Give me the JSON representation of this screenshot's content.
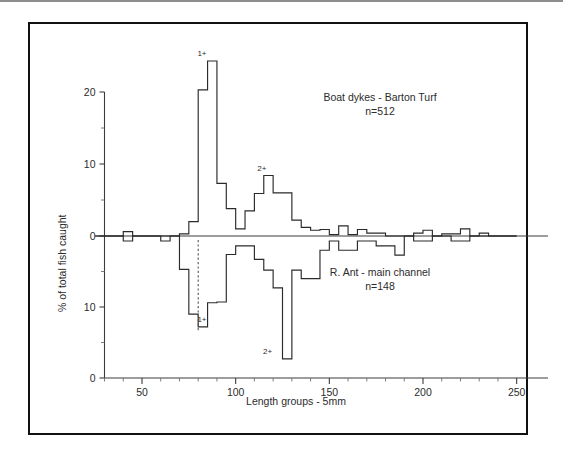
{
  "figure": {
    "y_axis_title": "% of total fish caught",
    "x_axis_title": "Length groups - 5mm",
    "x_ticks": [
      "50",
      "100",
      "150",
      "200",
      "250"
    ],
    "x_tick_values": [
      50,
      100,
      150,
      200,
      250
    ],
    "x_minor_step": 10,
    "x_range": [
      25,
      250
    ],
    "top_panel": {
      "caption_line1": "Boat dykes - Barton Turf",
      "caption_line2": "n=512",
      "y_ticks": [
        "0",
        "10",
        "20"
      ],
      "y_tick_values": [
        0,
        10,
        20
      ],
      "y_minor_values": [
        5,
        15
      ],
      "annotations": [
        {
          "label": "1+",
          "x": 82,
          "y": 24.3
        },
        {
          "label": "2+",
          "x": 114,
          "y": 8.4
        }
      ]
    },
    "bottom_panel": {
      "caption_line1": "R. Ant - main channel",
      "caption_line2": "n=148",
      "y_ticks": [
        "0",
        "10",
        "0"
      ],
      "y_tick_values": [
        0,
        10,
        20
      ],
      "y_minor_values": [
        5,
        15
      ],
      "annotations": [
        {
          "label": "1+",
          "x": 82,
          "y": 12.8
        },
        {
          "label": "2+",
          "x": 117,
          "y": 17.3
        }
      ],
      "guide_line": {
        "x": 80,
        "y_from": 0,
        "y_to": 13.6
      }
    },
    "colors": {
      "frame": "#111111",
      "axis": "#3c3c3c",
      "histogram": "#2a2a2a",
      "text": "#2b2b2b",
      "guide": "#555555",
      "background": "#ffffff"
    }
  },
  "chart_data": [
    {
      "type": "bar",
      "title": "Boat dykes - Barton Turf",
      "subtitle": "n=512",
      "xlabel": "Length groups - 5mm",
      "ylabel": "% of total fish caught",
      "xlim": [
        25,
        250
      ],
      "ylim": [
        0,
        25
      ],
      "bin_width": 5,
      "grid": false,
      "orientation": "up",
      "bin_starts": [
        25,
        30,
        35,
        40,
        45,
        50,
        55,
        60,
        65,
        70,
        75,
        80,
        85,
        90,
        95,
        100,
        105,
        110,
        115,
        120,
        125,
        130,
        135,
        140,
        145,
        150,
        155,
        160,
        165,
        170,
        175,
        180,
        185,
        190,
        195,
        200,
        205,
        210,
        215,
        220,
        225,
        230,
        235,
        240,
        245
      ],
      "values": [
        0,
        0,
        0,
        0.6,
        0,
        0,
        0,
        0,
        0,
        0.3,
        2.0,
        20.3,
        24.3,
        7.3,
        3.8,
        1.0,
        3.5,
        5.9,
        8.4,
        6.0,
        6.0,
        2.2,
        1.2,
        0.8,
        0.9,
        0.2,
        1.4,
        0.2,
        0.9,
        0.4,
        0.4,
        0,
        0,
        0,
        0.4,
        0.8,
        0,
        0.3,
        0.3,
        1.0,
        0,
        0.4,
        0,
        0,
        0
      ],
      "annotations": [
        {
          "label": "1+",
          "x": 82,
          "y": 24.3
        },
        {
          "label": "2+",
          "x": 114,
          "y": 8.4
        }
      ]
    },
    {
      "type": "bar",
      "title": "R. Ant - main channel",
      "subtitle": "n=148",
      "xlabel": "Length groups - 5mm",
      "ylabel": "% of total fish caught",
      "xlim": [
        25,
        250
      ],
      "ylim": [
        0,
        20
      ],
      "bin_width": 5,
      "grid": false,
      "orientation": "down",
      "bin_starts": [
        25,
        30,
        35,
        40,
        45,
        50,
        55,
        60,
        65,
        70,
        75,
        80,
        85,
        90,
        95,
        100,
        105,
        110,
        115,
        120,
        125,
        130,
        135,
        140,
        145,
        150,
        155,
        160,
        165,
        170,
        175,
        180,
        185,
        190,
        195,
        200,
        205,
        210,
        215,
        220,
        225,
        230,
        235,
        240,
        245
      ],
      "values": [
        0,
        0,
        0,
        0.7,
        0,
        0,
        0,
        0.7,
        0,
        4.7,
        11.0,
        12.8,
        9.4,
        9.3,
        2.6,
        1.4,
        1.4,
        3.3,
        4.8,
        7.3,
        17.3,
        4.8,
        6.0,
        6.0,
        2.0,
        0.7,
        2.0,
        2.0,
        0.7,
        0.7,
        1.4,
        1.4,
        2.7,
        0,
        0.7,
        0.7,
        0,
        0,
        0.7,
        0.7,
        0,
        0,
        0,
        0,
        0
      ],
      "annotations": [
        {
          "label": "1+",
          "x": 82,
          "y": 12.8
        },
        {
          "label": "2+",
          "x": 117,
          "y": 17.3
        }
      ]
    }
  ]
}
